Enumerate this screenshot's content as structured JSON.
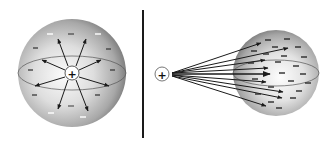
{
  "figure": {
    "colors": {
      "background": "#ffffff",
      "sphere_light": "#f4f4f4",
      "sphere_mid": "#bdbdbd",
      "sphere_dark": "#6f6f6f",
      "line": "#1a1a1a",
      "minus_mark_light": "#ffffff",
      "minus_mark_dark": "#3a3a3a"
    },
    "left_panel": {
      "description": "Positive charge at center of sphere, field lines radiating outward",
      "center_charge_symbol": "+",
      "surface_charge_symbol": "−"
    },
    "divider": {
      "x": 143
    },
    "right_panel": {
      "description": "Positive point charge outside sphere, field lines converging on induced negative charges",
      "point_charge_symbol": "+",
      "surface_charge_symbol": "−"
    }
  }
}
